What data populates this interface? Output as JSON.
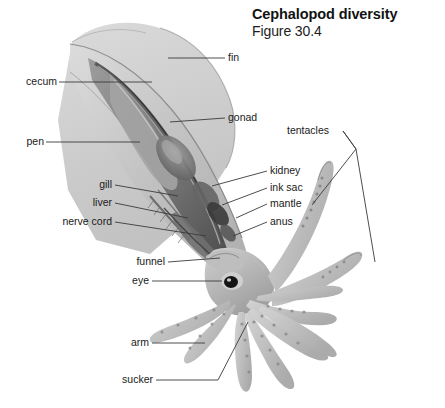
{
  "figure": {
    "title": "Cephalopod diversity",
    "figure_number": "Figure 30.4",
    "background_color": "#ffffff",
    "line_color": "#3a3a3a",
    "text_color": "#1a1a1a"
  },
  "labels": {
    "fin": "fin",
    "cecum": "cecum",
    "gonad": "gonad",
    "pen": "pen",
    "tentacles": "tentacles",
    "kidney": "kidney",
    "ink_sac": "ink sac",
    "gill": "gill",
    "liver": "liver",
    "mantle": "mantle",
    "nerve_cord": "nerve cord",
    "anus": "anus",
    "funnel": "funnel",
    "eye": "eye",
    "arm": "arm",
    "sucker": "sucker"
  },
  "palette": {
    "mantle_light": "#d2d2d2",
    "mantle_mid": "#b4b4b4",
    "mantle_dark": "#7d7d7d",
    "organ_dark": "#4a4a4a",
    "organ_darkest": "#2e2e2e",
    "arm_light": "#c9c9c9",
    "arm_shade": "#a8a8a8",
    "eye_black": "#111111"
  }
}
